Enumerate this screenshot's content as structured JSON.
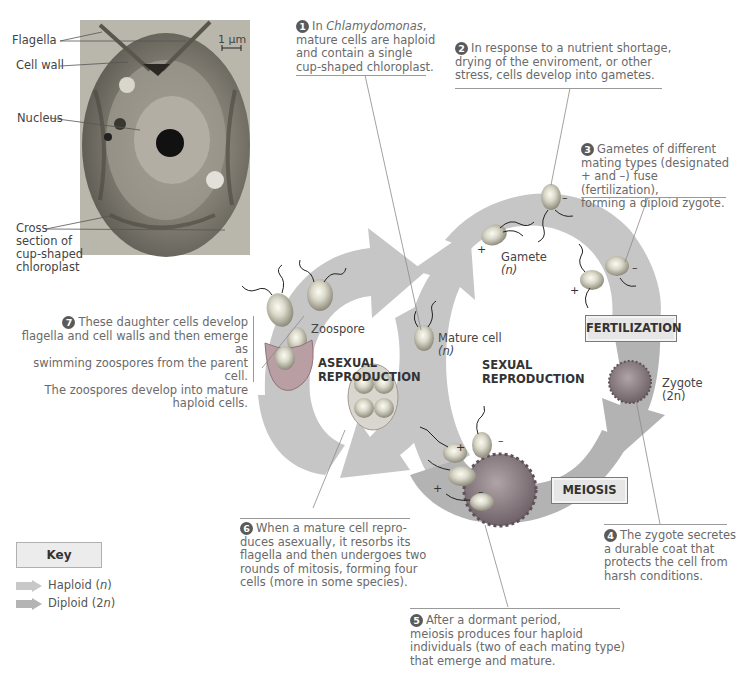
{
  "micrograph": {
    "scale_bar": "1 µm",
    "labels": {
      "flagella": "Flagella",
      "cell_wall": "Cell wall",
      "nucleus": "Nucleus",
      "chloroplast_line1": "Cross",
      "chloroplast_line2": "section of",
      "chloroplast_line3": "cup-shaped",
      "chloroplast_line4": "chloroplast"
    }
  },
  "steps": [
    {
      "num": "1",
      "lines": [
        "In Chlamydomonas,",
        "mature cells are haploid",
        "and contain a single",
        "cup-shaped chloroplast."
      ],
      "italic": "Chlamydomonas"
    },
    {
      "num": "2",
      "lines": [
        "In response to a nutrient shortage,",
        "drying of the enviroment, or other",
        "stress, cells develop into gametes."
      ]
    },
    {
      "num": "3",
      "lines": [
        "Gametes of different",
        "mating types (designated",
        "+ and –) fuse (fertilization),",
        "forming a diploid zygote."
      ]
    },
    {
      "num": "4",
      "lines": [
        "The zygote secretes",
        "a durable coat that",
        "protects the cell from",
        "harsh conditions."
      ]
    },
    {
      "num": "5",
      "lines": [
        "After a dormant period,",
        "meiosis produces four haploid",
        "individuals (two of each mating type)",
        "that emerge and mature."
      ]
    },
    {
      "num": "6",
      "lines": [
        "When a mature cell repro-",
        "duces asexually, it resorbs its",
        "flagella and then undergoes two",
        "rounds of mitosis, forming four",
        "cells (more in some species)."
      ]
    },
    {
      "num": "7",
      "lines": [
        "These daughter cells develop",
        "flagella and cell walls and then emerge as",
        "swimming zoospores from the parent cell.",
        "The zoospores develop into mature",
        "haploid cells."
      ]
    }
  ],
  "cell_labels": {
    "zoospore": "Zoospore",
    "mature_cell": "Mature cell",
    "mature_cell_ploidy": "(n)",
    "gamete": "Gamete",
    "gamete_ploidy": "(n)",
    "zygote": "Zygote",
    "zygote_ploidy": "(2n)",
    "plus": "+",
    "minus": "–"
  },
  "stages": {
    "asexual_line1": "ASEXUAL",
    "asexual_line2": "REPRODUCTION",
    "sexual_line1": "SEXUAL",
    "sexual_line2": "REPRODUCTION",
    "fertilization": "FERTILIZATION",
    "meiosis": "MEIOSIS"
  },
  "key": {
    "title": "Key",
    "items": [
      {
        "label_prefix": "Haploid (",
        "label_italic": "n",
        "label_suffix": ")",
        "color": "#c8c8c8"
      },
      {
        "label_prefix": "Diploid (2",
        "label_italic": "n",
        "label_suffix": ")",
        "color": "#b4b4b4"
      }
    ]
  },
  "colors": {
    "haploid_band": "#c6c6c6",
    "diploid_band": "#b3b3b3",
    "leader_line": "#8a8a8a",
    "caption_text": "#6a6a6a",
    "number_badge": "#5a5a5a"
  }
}
